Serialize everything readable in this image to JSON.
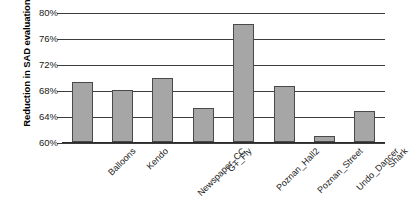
{
  "chart_data": {
    "type": "bar",
    "title": "",
    "subtitle": "",
    "xlabel": "",
    "ylabel": "Reduction in SAD evaluations",
    "categories": [
      "Balloons",
      "Kendo",
      "Newspaper_CC",
      "GT_Fly",
      "Poznan_Hall2",
      "Poznan_Street",
      "Undo_Dancer",
      "Shark"
    ],
    "values": [
      69.2,
      68.0,
      69.9,
      65.3,
      78.1,
      68.6,
      61.0,
      64.7
    ],
    "value_labels": [
      "",
      "",
      "",
      "",
      "",
      "",
      "",
      ""
    ],
    "ylim": [
      60,
      80
    ],
    "ytick_values": [
      80,
      76,
      72,
      68,
      64,
      60
    ],
    "ytick_labels": [
      "80%",
      "76%",
      "72%",
      "68%",
      "64%",
      "60%"
    ],
    "grid": true,
    "grid_axis": "y",
    "legend": false,
    "legend_position": "none",
    "bar_fill_color": "#a6a6a6",
    "bar_border_color": "#4a4a4a",
    "gridline_color": "#3d3d3d",
    "background_color": "#ffffff",
    "text_color": "#1a1a1a"
  }
}
